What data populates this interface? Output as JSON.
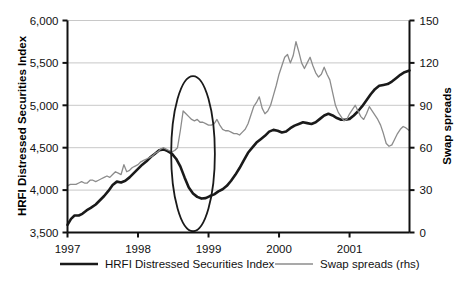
{
  "chart_data": {
    "type": "line",
    "title": "",
    "xlabel": "",
    "ylabel": "HRFI Distressed Securities Index",
    "y2label": "Swap spreads",
    "grid": true,
    "legend_position": "bottom",
    "xlim": [
      1997.0,
      2001.85
    ],
    "xticks": [
      "1997",
      "1998",
      "1999",
      "2000",
      "2001"
    ],
    "xtick_values": [
      1997,
      1998,
      1999,
      2000,
      2001
    ],
    "ylim": [
      3500,
      6000
    ],
    "yticks": [
      "3,500",
      "4,000",
      "4,500",
      "5,000",
      "5,500",
      "6,000"
    ],
    "ytick_values": [
      3500,
      4000,
      4500,
      5000,
      5500,
      6000
    ],
    "y2lim": [
      0,
      150
    ],
    "y2ticks": [
      "0",
      "30",
      "60",
      "90",
      "120",
      "150"
    ],
    "y2tick_values": [
      0,
      30,
      60,
      90,
      120,
      150
    ],
    "series": [
      {
        "name": "HRFI Distressed Securities Index",
        "axis": "left",
        "color": "#1a1a1a",
        "width": 2.6,
        "x": [
          1997.0,
          1997.05,
          1997.1,
          1997.16,
          1997.21,
          1997.27,
          1997.33,
          1997.4,
          1997.46,
          1997.52,
          1997.58,
          1997.64,
          1997.7,
          1997.76,
          1997.82,
          1997.88,
          1997.94,
          1998.0,
          1998.06,
          1998.12,
          1998.18,
          1998.24,
          1998.3,
          1998.36,
          1998.42,
          1998.48,
          1998.54,
          1998.6,
          1998.66,
          1998.72,
          1998.78,
          1998.84,
          1998.9,
          1998.96,
          1999.02,
          1999.08,
          1999.14,
          1999.2,
          1999.26,
          1999.32,
          1999.38,
          1999.44,
          1999.5,
          1999.56,
          1999.62,
          1999.68,
          1999.74,
          1999.8,
          1999.86,
          1999.92,
          1999.98,
          2000.04,
          2000.1,
          2000.16,
          2000.22,
          2000.28,
          2000.34,
          2000.4,
          2000.46,
          2000.52,
          2000.58,
          2000.64,
          2000.7,
          2000.76,
          2000.82,
          2000.88,
          2000.94,
          2001.0,
          2001.06,
          2001.12,
          2001.18,
          2001.24,
          2001.3,
          2001.36,
          2001.42,
          2001.48,
          2001.54,
          2001.6,
          2001.66,
          2001.72,
          2001.78,
          2001.85
        ],
        "y": [
          3590,
          3660,
          3700,
          3700,
          3720,
          3760,
          3790,
          3830,
          3880,
          3930,
          3990,
          4060,
          4100,
          4090,
          4110,
          4150,
          4200,
          4250,
          4300,
          4340,
          4390,
          4430,
          4470,
          4480,
          4460,
          4430,
          4370,
          4280,
          4150,
          4030,
          3960,
          3920,
          3900,
          3905,
          3930,
          3950,
          3985,
          4010,
          4050,
          4110,
          4180,
          4260,
          4350,
          4440,
          4500,
          4560,
          4600,
          4640,
          4690,
          4710,
          4700,
          4680,
          4690,
          4730,
          4760,
          4780,
          4800,
          4790,
          4780,
          4800,
          4840,
          4880,
          4900,
          4880,
          4850,
          4830,
          4830,
          4840,
          4880,
          4930,
          4990,
          5060,
          5130,
          5190,
          5230,
          5240,
          5250,
          5280,
          5320,
          5360,
          5390,
          5410
        ]
      },
      {
        "name": "Swap spreads (rhs)",
        "axis": "right",
        "color": "#8c8c8c",
        "width": 1.3,
        "x": [
          1997.0,
          1997.04,
          1997.08,
          1997.12,
          1997.16,
          1997.2,
          1997.24,
          1997.28,
          1997.32,
          1997.36,
          1997.4,
          1997.44,
          1997.48,
          1997.52,
          1997.56,
          1997.6,
          1997.64,
          1997.68,
          1997.72,
          1997.76,
          1997.8,
          1997.84,
          1997.88,
          1997.92,
          1997.96,
          1998.0,
          1998.04,
          1998.08,
          1998.12,
          1998.16,
          1998.2,
          1998.24,
          1998.28,
          1998.32,
          1998.36,
          1998.4,
          1998.44,
          1998.48,
          1998.52,
          1998.56,
          1998.6,
          1998.64,
          1998.68,
          1998.72,
          1998.76,
          1998.8,
          1998.84,
          1998.88,
          1998.92,
          1998.96,
          1999.0,
          1999.04,
          1999.08,
          1999.12,
          1999.16,
          1999.2,
          1999.24,
          1999.28,
          1999.32,
          1999.36,
          1999.4,
          1999.44,
          1999.48,
          1999.52,
          1999.56,
          1999.6,
          1999.64,
          1999.68,
          1999.72,
          1999.76,
          1999.8,
          1999.84,
          1999.88,
          1999.92,
          1999.96,
          2000.0,
          2000.04,
          2000.08,
          2000.12,
          2000.16,
          2000.2,
          2000.24,
          2000.28,
          2000.32,
          2000.36,
          2000.4,
          2000.44,
          2000.48,
          2000.52,
          2000.56,
          2000.6,
          2000.64,
          2000.68,
          2000.72,
          2000.76,
          2000.8,
          2000.84,
          2000.88,
          2000.92,
          2000.96,
          2001.0,
          2001.04,
          2001.08,
          2001.12,
          2001.16,
          2001.2,
          2001.24,
          2001.28,
          2001.32,
          2001.36,
          2001.4,
          2001.44,
          2001.48,
          2001.52,
          2001.56,
          2001.6,
          2001.64,
          2001.68,
          2001.72,
          2001.76,
          2001.8,
          2001.85
        ],
        "y": [
          33,
          34,
          34,
          34,
          35,
          36,
          35,
          35,
          37,
          37,
          36,
          37,
          38,
          39,
          40,
          39,
          41,
          43,
          42,
          41,
          48,
          43,
          44,
          46,
          47,
          48,
          50,
          51,
          52,
          53,
          54,
          56,
          57,
          59,
          60,
          59,
          58,
          57,
          58,
          60,
          72,
          86,
          84,
          82,
          80,
          79,
          80,
          78,
          78,
          77,
          76,
          76,
          77,
          80,
          76,
          73,
          72,
          72,
          71,
          70,
          70,
          69,
          71,
          73,
          77,
          83,
          89,
          92,
          96,
          88,
          84,
          86,
          90,
          97,
          104,
          112,
          118,
          124,
          126,
          120,
          125,
          135,
          128,
          120,
          116,
          120,
          124,
          118,
          113,
          110,
          112,
          117,
          112,
          108,
          99,
          90,
          85,
          82,
          79,
          80,
          84,
          87,
          90,
          86,
          82,
          80,
          84,
          89,
          86,
          83,
          80,
          76,
          70,
          63,
          61,
          62,
          66,
          70,
          73,
          75,
          74,
          72
        ]
      }
    ],
    "annotations": [
      {
        "type": "ellipse",
        "name": "highlight-ellipse",
        "cx_value": 1998.78,
        "cy_value_left": 4430,
        "rx_value": 0.31,
        "ry_value_left": 915,
        "color": "#1a1a1a"
      }
    ],
    "legend": [
      {
        "label": "HRFI Distressed Securities Index",
        "color": "#1a1a1a",
        "width": 2.6
      },
      {
        "label": "Swap spreads (rhs)",
        "color": "#8c8c8c",
        "width": 1.3
      }
    ],
    "colors": {
      "grid": "#c8c8c8",
      "axis": "#111111",
      "background": "#ffffff",
      "hrfi_line": "#1a1a1a",
      "swap_line": "#8c8c8c"
    }
  }
}
